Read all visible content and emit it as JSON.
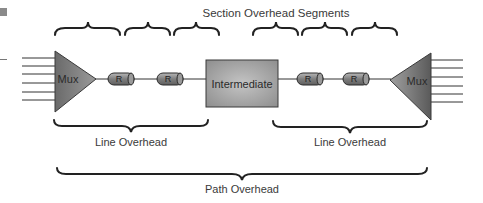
{
  "title": "Section Overhead Segments",
  "nodes": {
    "left_mux": {
      "label": "Mux",
      "inputs": 6
    },
    "right_mux": {
      "label": "Mux",
      "inputs": 6
    },
    "intermediate": {
      "label": "Intermediate"
    },
    "repeaters": [
      {
        "label": "R"
      },
      {
        "label": "R"
      },
      {
        "label": "R"
      },
      {
        "label": "R"
      }
    ]
  },
  "braces": {
    "section_segments": 6,
    "line_overhead": [
      {
        "label": "Line Overhead"
      },
      {
        "label": "Line Overhead"
      }
    ],
    "path_overhead": {
      "label": "Path Overhead"
    }
  },
  "colors": {
    "mux_fill": "#7a7a7a",
    "intermediate_fill": "#a8a8a8",
    "repeater_fill": "#8c8c8c",
    "line": "#333333",
    "text": "#3a3a3a"
  }
}
